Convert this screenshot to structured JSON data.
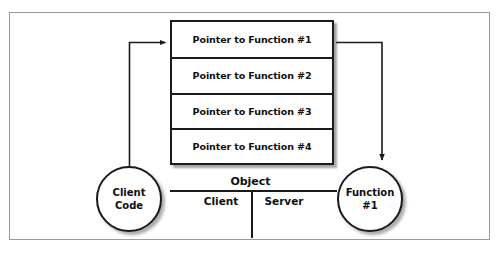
{
  "diagram": {
    "vtable": {
      "name": "pointer-table",
      "rows": [
        {
          "label": "Pointer to Function #1"
        },
        {
          "label": "Pointer to Function #2"
        },
        {
          "label": "Pointer to Function #3"
        },
        {
          "label": "Pointer to Function #4"
        }
      ]
    },
    "nodes": {
      "client": {
        "line1": "Client",
        "line2": "Code"
      },
      "function": {
        "line1": "Function",
        "line2": "#1"
      }
    },
    "boundary": {
      "object_label": "Object",
      "client_label": "Client",
      "server_label": "Server"
    },
    "colors": {
      "stroke": "#1a1a1a",
      "frame": "#9a9a9a",
      "background": "#ffffff",
      "shadow": "#5a5a5a"
    }
  }
}
